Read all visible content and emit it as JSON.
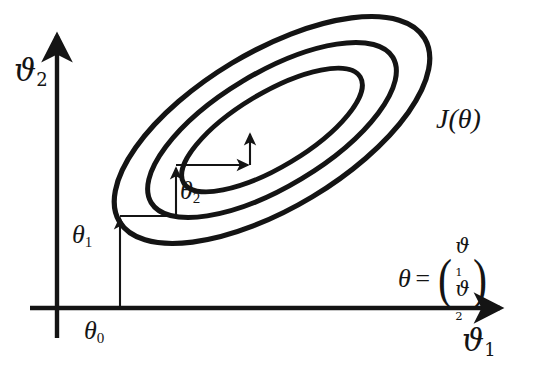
{
  "figure": {
    "kind": "contour-plot-with-descent-path",
    "title": "",
    "background_color": "#ffffff",
    "ink_color": "#141414"
  },
  "axes": {
    "x_axis": {
      "name": "horizontal-axis",
      "label": "ϑ",
      "label_sub": "1",
      "arrow": true,
      "y_position_px": 308,
      "x_start_px": 30,
      "x_end_px": 506
    },
    "y_axis": {
      "name": "vertical-axis",
      "label": "ϑ",
      "label_sub": "2",
      "arrow": true,
      "x_position_px": 57,
      "y_start_px": 338,
      "y_end_px": 30
    }
  },
  "contours": {
    "label": "J(θ)",
    "count": 3,
    "shape": "ellipse",
    "rotation_deg": -31,
    "center_px": {
      "x": 272,
      "y": 130
    },
    "levels": [
      {
        "name": "outer-contour",
        "rx": 178,
        "ry": 78
      },
      {
        "name": "middle-contour",
        "rx": 141,
        "ry": 57
      },
      {
        "name": "inner-contour",
        "rx": 103,
        "ry": 37
      }
    ]
  },
  "path": {
    "name": "descent-staircase",
    "start_label": "θ",
    "start_sub": "0",
    "steps": [
      {
        "label": "θ",
        "sub": "1",
        "direction": "up",
        "from": {
          "x": 120,
          "y": 308
        },
        "to": {
          "x": 120,
          "y": 216
        }
      },
      {
        "label": "",
        "sub": "",
        "direction": "right",
        "from": {
          "x": 120,
          "y": 216
        },
        "to": {
          "x": 176,
          "y": 216
        }
      },
      {
        "label": "θ",
        "sub": "2",
        "direction": "up",
        "from": {
          "x": 176,
          "y": 216
        },
        "to": {
          "x": 176,
          "y": 165
        }
      },
      {
        "label": "",
        "sub": "",
        "direction": "right",
        "from": {
          "x": 176,
          "y": 165
        },
        "to": {
          "x": 250,
          "y": 165
        }
      },
      {
        "label": "",
        "sub": "",
        "direction": "up",
        "from": {
          "x": 250,
          "y": 165
        },
        "to": {
          "x": 250,
          "y": 132
        }
      }
    ]
  },
  "annotations": {
    "cost_function": {
      "name": "cost-function-label",
      "text": "J(θ)"
    },
    "theta_zero": {
      "symbol": "θ",
      "subscript": "0"
    },
    "theta_one": {
      "symbol": "θ",
      "subscript": "1"
    },
    "theta_two": {
      "symbol": "θ",
      "subscript": "2"
    },
    "vector_equation": {
      "lhs": "θ",
      "operator": "=",
      "components": [
        {
          "symbol": "ϑ",
          "subscript": "1"
        },
        {
          "symbol": "ϑ",
          "subscript": "2"
        }
      ],
      "open_paren": "(",
      "close_paren": ")"
    }
  }
}
